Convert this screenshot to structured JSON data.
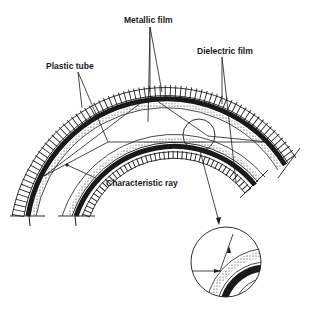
{
  "figure": {
    "labels": {
      "metallic_film": "Metallic film",
      "plastic_tube": "Plastic tube",
      "dielectric_film": "Dielectric film",
      "characteristic_ray": "Characteristic ray"
    },
    "colors": {
      "ink": "#1a1a1a",
      "background": "#ffffff"
    }
  }
}
